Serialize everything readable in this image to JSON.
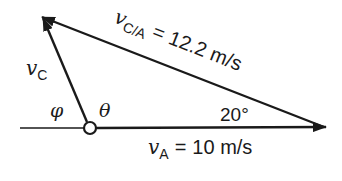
{
  "diagram": {
    "type": "vector-triangle",
    "colors": {
      "stroke": "#1a1a1a",
      "background": "#ffffff"
    },
    "vectors": {
      "vC": {
        "symbol": "v",
        "subscript": "C"
      },
      "vCA": {
        "symbol": "v",
        "subscript": "C/A",
        "equals": "=",
        "value": "12.2 m/s"
      },
      "vA": {
        "symbol": "v",
        "subscript": "A",
        "equals": "=",
        "value": "10 m/s"
      }
    },
    "angles": {
      "phi": "φ",
      "theta": "θ",
      "known": "20°"
    }
  }
}
